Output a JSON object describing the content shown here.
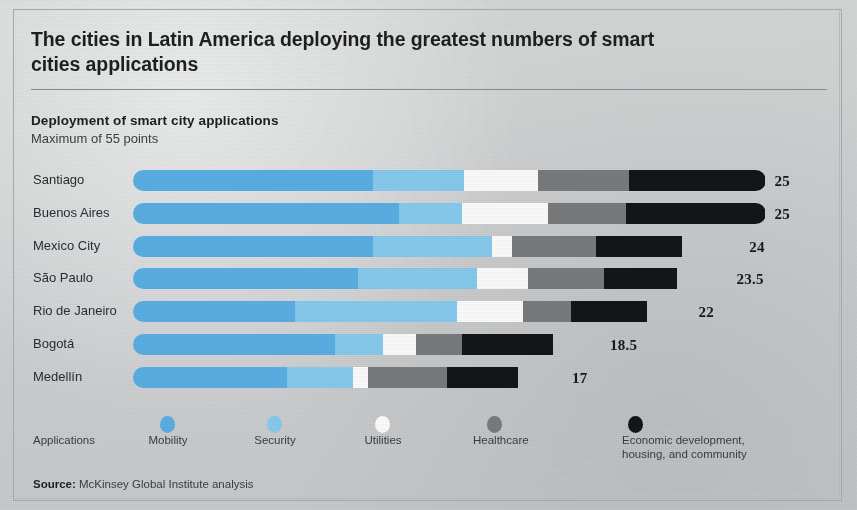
{
  "title": "The cities in Latin America deploying the greatest numbers of smart cities applications",
  "subtitle": "Deployment of smart city applications",
  "subnote": "Maximum of 55 points",
  "legend": {
    "axis_label": "Applications",
    "items": [
      {
        "name": "Mobility",
        "color": "#5aaee2"
      },
      {
        "name": "Security",
        "color": "#86caed"
      },
      {
        "name": "Utilities",
        "color": "#fbfbfb"
      },
      {
        "name": "Healthcare",
        "color": "#787a7b"
      },
      {
        "name": "Economic development,\nhousing, and community",
        "color": "#141516"
      }
    ]
  },
  "source": {
    "label": "Source:",
    "text": " McKinsey Global Institute analysis"
  },
  "chart_data": {
    "type": "bar",
    "title": "Deployment of smart city applications",
    "subtitle": "Maximum of 55 points",
    "orientation": "horizontal",
    "stacked": true,
    "xlabel": "",
    "ylabel": "",
    "xlim": [
      0,
      28
    ],
    "grid": false,
    "legend_position": "bottom",
    "categories": [
      "Santiago",
      "Buenos Aires",
      "Mexico City",
      "São Paulo",
      "Rio de Janeiro",
      "Bogotá",
      "Medellín"
    ],
    "totals": [
      25,
      25,
      24,
      23.5,
      22,
      18.5,
      17
    ],
    "total_labels": [
      "25",
      "25",
      "24",
      "23.5",
      "22",
      "18.5",
      "17"
    ],
    "series": [
      {
        "name": "Mobility",
        "color": "#5aaee2",
        "values": [
          9.5,
          10.5,
          9.5,
          8.9,
          6.4,
          8.0,
          6.1
        ]
      },
      {
        "name": "Security",
        "color": "#86caed",
        "values": [
          3.6,
          2.5,
          4.7,
          4.7,
          6.4,
          1.9,
          2.6
        ]
      },
      {
        "name": "Utilities",
        "color": "#fbfbfb",
        "values": [
          2.9,
          3.4,
          0.8,
          2.0,
          2.6,
          1.3,
          0.6
        ]
      },
      {
        "name": "Healthcare",
        "color": "#787a7b",
        "values": [
          3.6,
          3.1,
          3.3,
          3.0,
          1.9,
          1.8,
          3.1
        ]
      },
      {
        "name": "Economic development, housing, and community",
        "color": "#141516",
        "values": [
          5.4,
          5.5,
          3.4,
          2.9,
          3.0,
          3.6,
          2.8
        ]
      }
    ]
  }
}
